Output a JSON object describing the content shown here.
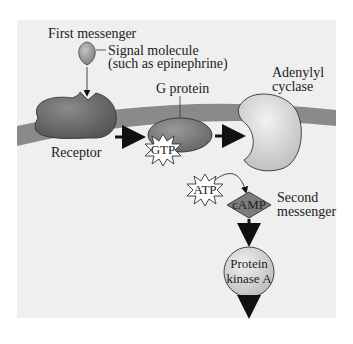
{
  "colors": {
    "background": "#ffffff",
    "panel": "#efefef",
    "membrane": "#8a8a8a",
    "receptor": "#6b6b6b",
    "g_protein": "#7a7a7a",
    "adenylyl_cyclase": "#d6d6d6",
    "camp": "#7c7c7c",
    "protein_kinase": "#d4d4d4",
    "signal_molecule": "#9a9a9a",
    "arrow": "#111111"
  },
  "labels": {
    "first_messenger": "First messenger",
    "signal_molecule_line1": "Signal molecule",
    "signal_molecule_line2": "(such as epinephrine)",
    "adenylyl_line1": "Adenylyl",
    "adenylyl_line2": "cyclase",
    "g_protein": "G protein",
    "receptor": "Receptor",
    "gtp": "GTP",
    "atp": "ATP",
    "camp": "cAMP",
    "second_messenger_line1": "Second",
    "second_messenger_line2": "messenger",
    "protein_kinase_line1": "Protein",
    "protein_kinase_line2": "kinase A"
  }
}
